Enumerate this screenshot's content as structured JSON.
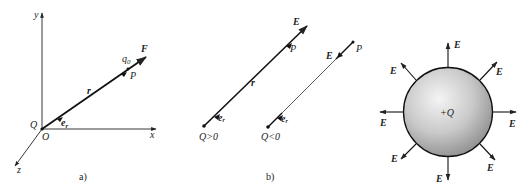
{
  "panel_a": {
    "caption": "a)",
    "axis_x": "x",
    "axis_y": "y",
    "axis_z": "z",
    "origin": "O",
    "source_charge": "Q",
    "unit_vector": "e",
    "unit_vector_sub": "r",
    "position_vector": "r",
    "test_charge": "q",
    "test_charge_sub": "0",
    "point": "P",
    "force": "F"
  },
  "panel_b": {
    "caption": "b)",
    "positive": {
      "field": "E",
      "point": "P",
      "vector": "r",
      "unit_vector": "e",
      "unit_vector_sub": "r",
      "charge_label": "Q>0"
    },
    "negative": {
      "field": "E",
      "point": "P",
      "unit_vector": "e",
      "unit_vector_sub": "r",
      "charge_label": "Q<0"
    }
  },
  "panel_c": {
    "charge_label": "+Q",
    "field_labels": [
      "E",
      "E",
      "E",
      "E",
      "E",
      "E",
      "E",
      "E"
    ]
  }
}
